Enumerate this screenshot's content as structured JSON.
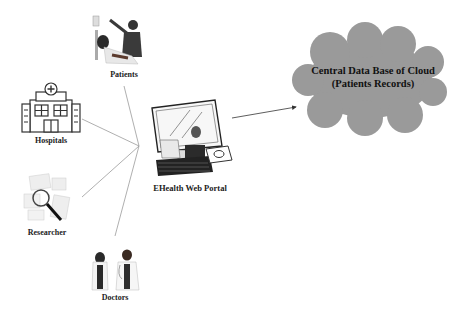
{
  "diagram": {
    "nodes": {
      "patients": {
        "label": "Patients",
        "icon": "patient-with-caregiver-icon"
      },
      "hospitals": {
        "label": "Hospitals",
        "icon": "hospital-building-icon"
      },
      "researcher": {
        "label": "Researcher",
        "icon": "magnifier-over-documents-icon"
      },
      "doctors": {
        "label": "Doctors",
        "icon": "doctors-pair-icon"
      },
      "portal": {
        "label": "EHealth Web Portal",
        "icon": "computer-workstation-icon"
      },
      "cloud": {
        "line1": "Central Data Base of Cloud",
        "line2": "(Patients Records)",
        "fill": "#9a9a9a"
      }
    },
    "edges": [
      {
        "from": "patients",
        "to": "portal"
      },
      {
        "from": "hospitals",
        "to": "portal"
      },
      {
        "from": "researcher",
        "to": "portal"
      },
      {
        "from": "doctors",
        "to": "portal"
      },
      {
        "from": "portal",
        "to": "cloud",
        "arrow": true
      }
    ]
  }
}
